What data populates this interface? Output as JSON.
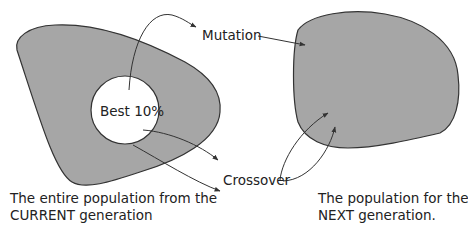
{
  "diagram": {
    "colors": {
      "population_fill": "#a6a6a6",
      "outline": "#333333",
      "arrow": "#333333",
      "background": "#ffffff"
    },
    "current_population": {
      "inner_label": "Best 10%",
      "caption_line1": "The entire population from the",
      "caption_line2": "CURRENT generation"
    },
    "next_population": {
      "caption_line1": "The population for the",
      "caption_line2": "NEXT generation."
    },
    "operations": {
      "mutation": "Mutation",
      "crossover": "Crossover"
    }
  }
}
